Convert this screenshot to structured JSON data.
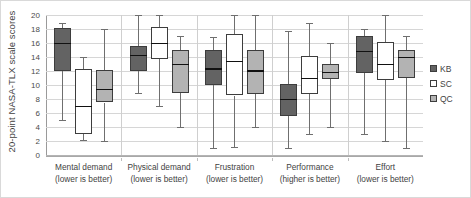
{
  "chart_data": {
    "type": "box",
    "title": "",
    "xlabel": "",
    "ylabel": "20-point NASA-TLX scale scores",
    "ylim": [
      0,
      20
    ],
    "ytick_step": 2,
    "yticks": [
      20,
      18,
      16,
      14,
      12,
      10,
      8,
      6,
      4,
      2,
      0
    ],
    "grid": true,
    "legend_position": "right",
    "categories": [
      {
        "line1": "Mental demand",
        "line2": "(lower is better)"
      },
      {
        "line1": "Physical demand",
        "line2": "(lower is better)"
      },
      {
        "line1": "Frustration",
        "line2": "(lower is better)"
      },
      {
        "line1": "Performance",
        "line2": "(higher is better)"
      },
      {
        "line1": "Effort",
        "line2": "(lower is better)"
      }
    ],
    "series": [
      {
        "name": "KB",
        "color": "#636363",
        "boxes": [
          {
            "category": "Mental demand",
            "min": 5.0,
            "q1": 12.0,
            "median": 16.0,
            "q3": 18.1,
            "max": 18.9
          },
          {
            "category": "Physical demand",
            "min": 8.9,
            "q1": 12.0,
            "median": 14.3,
            "q3": 15.6,
            "max": 20.0
          },
          {
            "category": "Frustration",
            "min": 1.0,
            "q1": 10.0,
            "median": 12.4,
            "q3": 15.0,
            "max": 16.8
          },
          {
            "category": "Performance",
            "min": 1.0,
            "q1": 5.6,
            "median": 8.0,
            "q3": 10.2,
            "max": 17.7
          },
          {
            "category": "Effort",
            "min": 3.0,
            "q1": 11.7,
            "median": 14.9,
            "q3": 17.0,
            "max": 18.0
          }
        ]
      },
      {
        "name": "SC",
        "color": "#ffffff",
        "boxes": [
          {
            "category": "Mental demand",
            "min": 2.1,
            "q1": 3.0,
            "median": 7.0,
            "q3": 12.3,
            "max": 14.0
          },
          {
            "category": "Physical demand",
            "min": 7.0,
            "q1": 13.7,
            "median": 16.0,
            "q3": 18.3,
            "max": 20.0
          },
          {
            "category": "Frustration",
            "min": 1.1,
            "q1": 8.5,
            "median": 13.5,
            "q3": 17.3,
            "max": 20.0
          },
          {
            "category": "Performance",
            "min": 3.0,
            "q1": 8.7,
            "median": 11.0,
            "q3": 14.2,
            "max": 18.8
          },
          {
            "category": "Effort",
            "min": 2.0,
            "q1": 10.7,
            "median": 13.0,
            "q3": 16.2,
            "max": 20.0
          }
        ]
      },
      {
        "name": "QC",
        "color": "#b3b3b3",
        "boxes": [
          {
            "category": "Mental demand",
            "min": 2.0,
            "q1": 7.5,
            "median": 9.5,
            "q3": 12.1,
            "max": 18.0
          },
          {
            "category": "Physical demand",
            "min": 4.0,
            "q1": 8.8,
            "median": 13.0,
            "q3": 15.0,
            "max": 17.0
          },
          {
            "category": "Frustration",
            "min": 4.0,
            "q1": 8.7,
            "median": 12.1,
            "q3": 15.0,
            "max": 20.0
          },
          {
            "category": "Performance",
            "min": 4.0,
            "q1": 10.8,
            "median": 11.9,
            "q3": 13.0,
            "max": 16.0
          },
          {
            "category": "Effort",
            "min": 1.0,
            "q1": 11.0,
            "median": 14.0,
            "q3": 15.0,
            "max": 17.0
          }
        ]
      }
    ]
  },
  "legend": {
    "items": [
      {
        "label": "KB",
        "color": "#636363"
      },
      {
        "label": "SC",
        "color": "#ffffff"
      },
      {
        "label": "QC",
        "color": "#b3b3b3"
      }
    ]
  }
}
